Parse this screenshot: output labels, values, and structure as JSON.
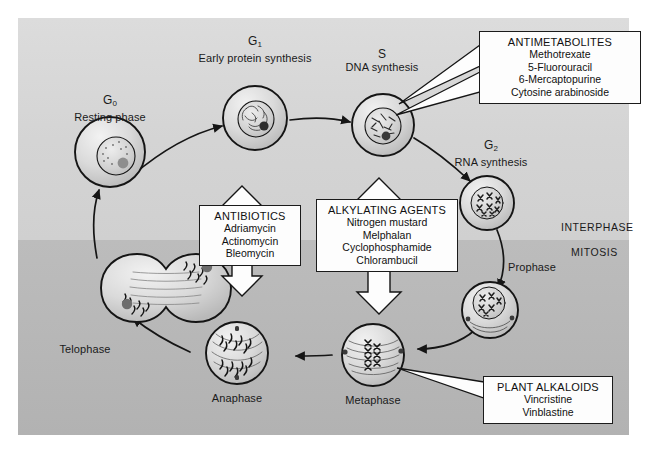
{
  "figure": {
    "panel_bg_interphase": "#d8d8d8",
    "panel_bg_mitosis": "#b8b8b8",
    "line_color": "#1a1a1a",
    "box_fill": "#fdfdfd"
  },
  "phase_bands": {
    "interphase_label": "INTERPHASE",
    "mitosis_label": "MITOSIS"
  },
  "cell_cycle": [
    {
      "id": "g0",
      "phase": "G",
      "sub": "0",
      "description": "Resting phase"
    },
    {
      "id": "g1",
      "phase": "G",
      "sub": "1",
      "description": "Early protein synthesis"
    },
    {
      "id": "s",
      "phase": "S",
      "sub": "",
      "description": "DNA synthesis"
    },
    {
      "id": "g2",
      "phase": "G",
      "sub": "2",
      "description": "RNA synthesis"
    },
    {
      "id": "prophase",
      "phase": "",
      "sub": "",
      "description": "Prophase"
    },
    {
      "id": "metaphase",
      "phase": "",
      "sub": "",
      "description": "Metaphase"
    },
    {
      "id": "anaphase",
      "phase": "",
      "sub": "",
      "description": "Anaphase"
    },
    {
      "id": "telophase",
      "phase": "",
      "sub": "",
      "description": "Telophase"
    }
  ],
  "drug_classes": [
    {
      "id": "antimetabolites",
      "heading": "ANTIMETABOLITES",
      "drugs": [
        "Methotrexate",
        "5-Fluorouracil",
        "6-Mercaptopurine",
        "Cytosine arabinoside"
      ],
      "targets": [
        "G1",
        "S"
      ]
    },
    {
      "id": "antibiotics",
      "heading": "ANTIBIOTICS",
      "drugs": [
        "Adriamycin",
        "Actinomycin",
        "Bleomycin"
      ],
      "targets": [
        "all phases"
      ]
    },
    {
      "id": "alkylating-agents",
      "heading": "ALKYLATING AGENTS",
      "drugs": [
        "Nitrogen mustard",
        "Melphalan",
        "Cyclophosphamide",
        "Chlorambucil"
      ],
      "targets": [
        "all phases"
      ]
    },
    {
      "id": "plant-alkaloids",
      "heading": "PLANT ALKALOIDS",
      "drugs": [
        "Vincristine",
        "Vinblastine"
      ],
      "targets": [
        "Metaphase"
      ]
    }
  ]
}
